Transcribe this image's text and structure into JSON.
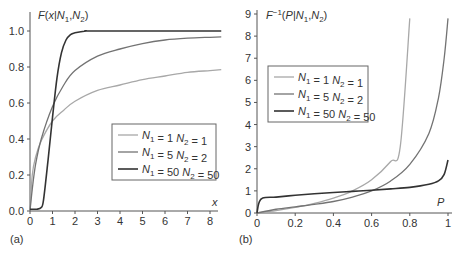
{
  "chart_data": [
    {
      "type": "line",
      "panel_label": "(a)",
      "title": "",
      "ylabel": "F(x|N1,N2)",
      "xlabel": "x",
      "xlim": [
        0,
        8.5
      ],
      "ylim": [
        0,
        1.05
      ],
      "xticks": [
        "0",
        "1",
        "2",
        "3",
        "4",
        "5",
        "6",
        "7",
        "8"
      ],
      "yticks": [
        "0.0",
        "0.2",
        "0.4",
        "0.6",
        "0.8",
        "1.0"
      ],
      "grid": false,
      "legend_position": "center-right",
      "series": [
        {
          "name": "N1 = 1 N2 = 1",
          "color": "#a8a8a8",
          "x": [
            0,
            0.1,
            0.25,
            0.5,
            1,
            1.5,
            2,
            3,
            4,
            5,
            6,
            7,
            8,
            8.5
          ],
          "y": [
            0,
            0.2,
            0.3,
            0.39,
            0.5,
            0.56,
            0.61,
            0.67,
            0.7,
            0.73,
            0.75,
            0.77,
            0.78,
            0.785
          ]
        },
        {
          "name": "N1 = 5 N2 = 2",
          "color": "#737373",
          "x": [
            0,
            0.1,
            0.25,
            0.5,
            1,
            1.5,
            2,
            3,
            4,
            5,
            6,
            7,
            8,
            8.5
          ],
          "y": [
            0,
            0.12,
            0.26,
            0.4,
            0.58,
            0.7,
            0.78,
            0.86,
            0.9,
            0.93,
            0.95,
            0.96,
            0.965,
            0.967
          ]
        },
        {
          "name": "N1 = 50 N2 = 50",
          "color": "#333333",
          "x": [
            0,
            0.3,
            0.5,
            0.6,
            0.8,
            1.0,
            1.2,
            1.4,
            1.6,
            1.8,
            2.0,
            2.5,
            3,
            8.5
          ],
          "y": [
            0.01,
            0.01,
            0.02,
            0.06,
            0.28,
            0.52,
            0.74,
            0.88,
            0.95,
            0.98,
            0.99,
            1.0,
            1.0,
            1.0
          ]
        }
      ]
    },
    {
      "type": "line",
      "panel_label": "(b)",
      "title": "",
      "ylabel": "F^-1(P|N1,N2)",
      "xlabel": "P",
      "xlim": [
        0,
        1
      ],
      "ylim": [
        0,
        9
      ],
      "xticks": [
        "0",
        "0.2",
        "0.4",
        "0.6",
        "0.8",
        "1"
      ],
      "yticks": [
        "0",
        "1",
        "2",
        "3",
        "4",
        "5",
        "6",
        "7",
        "8",
        "9"
      ],
      "grid": false,
      "legend_position": "upper-left",
      "series": [
        {
          "name": "N1 = 1 N2 = 1",
          "color": "#a8a8a8",
          "x": [
            0,
            0.1,
            0.2,
            0.3,
            0.4,
            0.5,
            0.6,
            0.7,
            0.75,
            0.8
          ],
          "y": [
            0,
            0.11,
            0.25,
            0.43,
            0.67,
            1.0,
            1.5,
            2.33,
            3.0,
            8.8
          ]
        },
        {
          "name": "N1 = 5 N2 = 2",
          "color": "#737373",
          "x": [
            0,
            0.1,
            0.2,
            0.3,
            0.4,
            0.5,
            0.6,
            0.7,
            0.8,
            0.9,
            0.95,
            0.98,
            1.0
          ],
          "y": [
            0,
            0.17,
            0.28,
            0.39,
            0.52,
            0.72,
            1.0,
            1.45,
            2.2,
            3.6,
            5.2,
            7.0,
            8.8
          ]
        },
        {
          "name": "N1 = 50 N2 = 50",
          "color": "#333333",
          "x": [
            0,
            0.01,
            0.03,
            0.1,
            0.2,
            0.3,
            0.4,
            0.5,
            0.6,
            0.7,
            0.8,
            0.9,
            0.95,
            0.98,
            1.0
          ],
          "y": [
            0,
            0.45,
            0.68,
            0.72,
            0.8,
            0.87,
            0.93,
            0.98,
            1.03,
            1.09,
            1.16,
            1.3,
            1.45,
            1.75,
            2.4
          ]
        }
      ]
    }
  ]
}
